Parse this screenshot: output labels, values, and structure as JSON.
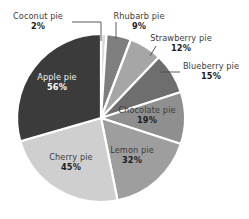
{
  "chart_data": {
    "type": "pie",
    "title": "",
    "subtitle": "",
    "xlabel": "",
    "ylabel": "",
    "legend_position": "none",
    "grid": false,
    "value_suffix": "%",
    "start_angle_deg": 0,
    "direction": "clockwise",
    "categories": [
      "Coconut pie",
      "Rhubarb pie",
      "Strawberry pie",
      "Blueberry pie",
      "Chocolate pie",
      "Lemon pie",
      "Cherry pie",
      "Apple pie"
    ],
    "values": [
      2,
      9,
      12,
      15,
      19,
      32,
      45,
      56
    ],
    "value_labels": [
      "2%",
      "9%",
      "12%",
      "15%",
      "19%",
      "32%",
      "45%",
      "56%"
    ],
    "colors": [
      "#d9d9d9",
      "#7f7f7f",
      "#a6a6a6",
      "#6e6e6e",
      "#8f8f8f",
      "#9e9e9e",
      "#cfcfcf",
      "#3b3b3b"
    ],
    "slices": [
      {
        "label": "Coconut pie",
        "value": 2,
        "display": "2%",
        "color": "#d9d9d9",
        "label_placement": "outside"
      },
      {
        "label": "Rhubarb pie",
        "value": 9,
        "display": "9%",
        "color": "#7f7f7f",
        "label_placement": "outside"
      },
      {
        "label": "Strawberry pie",
        "value": 12,
        "display": "12%",
        "color": "#a6a6a6",
        "label_placement": "outside"
      },
      {
        "label": "Blueberry pie",
        "value": 15,
        "display": "15%",
        "color": "#6e6e6e",
        "label_placement": "outside"
      },
      {
        "label": "Chocolate pie",
        "value": 19,
        "display": "19%",
        "color": "#8f8f8f",
        "label_placement": "inside"
      },
      {
        "label": "Lemon pie",
        "value": 32,
        "display": "32%",
        "color": "#9e9e9e",
        "label_placement": "inside"
      },
      {
        "label": "Cherry pie",
        "value": 45,
        "display": "45%",
        "color": "#cfcfcf",
        "label_placement": "inside"
      },
      {
        "label": "Apple pie",
        "value": 56,
        "display": "56%",
        "color": "#3b3b3b",
        "label_placement": "inside"
      }
    ],
    "background_color": "#ffffff",
    "slice_border_color": "#ffffff",
    "leader_line_color": "#4a4a4a"
  },
  "labels": {
    "coconut": {
      "name": "Coconut pie",
      "pct": "2%"
    },
    "rhubarb": {
      "name": "Rhubarb pie",
      "pct": "9%"
    },
    "strawberry": {
      "name": "Strawberry pie",
      "pct": "12%"
    },
    "blueberry": {
      "name": "Blueberry pie",
      "pct": "15%"
    },
    "chocolate": {
      "name": "Chocolate pie",
      "pct": "19%"
    },
    "lemon": {
      "name": "Lemon pie",
      "pct": "32%"
    },
    "cherry": {
      "name": "Cherry pie",
      "pct": "45%"
    },
    "apple": {
      "name": "Apple pie",
      "pct": "56%"
    }
  },
  "geometry": {
    "center_x": 101,
    "center_y": 118,
    "radius": 84
  }
}
